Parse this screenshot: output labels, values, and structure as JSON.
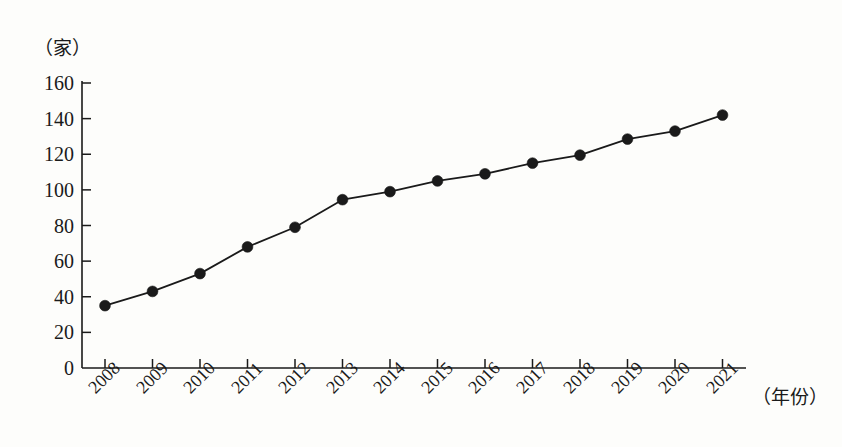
{
  "chart_data": {
    "type": "line",
    "title": "",
    "subtitle": "",
    "xlabel": "（年份）",
    "ylabel": "（家）",
    "categories": [
      "2008",
      "2009",
      "2010",
      "2011",
      "2012",
      "2013",
      "2014",
      "2015",
      "2016",
      "2017",
      "2018",
      "2019",
      "2020",
      "2021"
    ],
    "values": [
      35,
      43,
      53,
      68,
      79,
      94.5,
      99,
      105,
      109,
      115,
      119.5,
      128.5,
      133,
      142
    ],
    "series": [
      {
        "name": "",
        "values": [
          35,
          43,
          53,
          68,
          79,
          94.5,
          99,
          105,
          109,
          115,
          119.5,
          128.5,
          133,
          142
        ]
      }
    ],
    "ylim": [
      0,
      160
    ],
    "ytick_labels": [
      "0",
      "20",
      "40",
      "60",
      "80",
      "100",
      "120",
      "140",
      "160"
    ],
    "ytick_values": [
      0,
      20,
      40,
      60,
      80,
      100,
      120,
      140,
      160
    ],
    "xtick_labels": [
      "2008",
      "2009",
      "2010",
      "2011",
      "2012",
      "2013",
      "2014",
      "2015",
      "2016",
      "2017",
      "2018",
      "2019",
      "2020",
      "2021"
    ],
    "grid": false,
    "legend": "none",
    "marker": "filled-circle",
    "line_color": "#1a1a1a",
    "marker_color": "#1a1a1a",
    "background_color": "#fdfdfb",
    "axis_color": "#1a1a1a"
  }
}
